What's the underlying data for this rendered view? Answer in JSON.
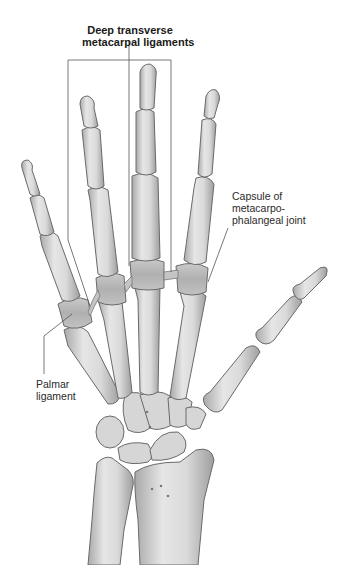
{
  "figure": {
    "labels": {
      "deep_transverse": {
        "line1": "Deep transverse",
        "line2": "metacarpal ligaments"
      },
      "capsule": {
        "line1": "Capsule of",
        "line2": "metacarpo-",
        "line3": "phalangeal joint"
      },
      "palmar": {
        "line1": "Palmar",
        "line2": "ligament"
      }
    },
    "colors": {
      "background": "#ffffff",
      "bone_fill": "#dcdcdc",
      "bone_shade": "#b8b8b8",
      "bone_outline": "#6a6a6a",
      "ligament": "#c4c4c4",
      "leader_line": "#555555",
      "text": "#2a2a2a"
    }
  }
}
